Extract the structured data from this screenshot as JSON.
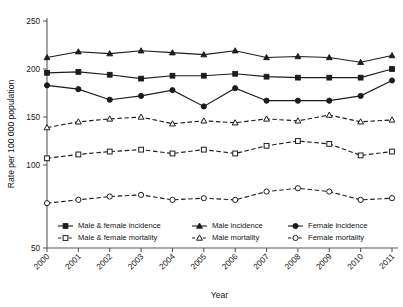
{
  "chart_data": {
    "type": "line",
    "title": "",
    "xlabel": "Year",
    "ylabel": "Rate per 100 000 population",
    "x": [
      "2000",
      "2001",
      "2002",
      "2003",
      "2004",
      "2005",
      "2006",
      "2007",
      "2008",
      "2009",
      "2010",
      "2011"
    ],
    "xlim": [
      2000,
      2011
    ],
    "ylim": [
      50,
      250
    ],
    "yticks": [
      50,
      100,
      150,
      200,
      250
    ],
    "grid": false,
    "legend_position": "bottom-inside",
    "series": [
      {
        "name": "Male & female incidence",
        "marker": "square-filled",
        "line_style": "solid",
        "values": [
          196,
          197,
          194,
          190,
          193,
          193,
          195,
          192,
          191,
          191,
          191,
          200
        ]
      },
      {
        "name": "Male incidence",
        "marker": "triangle-filled",
        "line_style": "solid",
        "values": [
          212,
          218,
          216,
          219,
          217,
          215,
          219,
          212,
          213,
          212,
          207,
          214
        ]
      },
      {
        "name": "Female incidence",
        "marker": "circle-filled",
        "line_style": "solid",
        "values": [
          183,
          179,
          168,
          172,
          178,
          161,
          180,
          167,
          167,
          167,
          172,
          188
        ]
      },
      {
        "name": "Male & female mortality",
        "marker": "square-open",
        "line_style": "dashed",
        "values": [
          107,
          111,
          114,
          116,
          112,
          116,
          112,
          120,
          125,
          122,
          110,
          114
        ]
      },
      {
        "name": "Male mortality",
        "marker": "triangle-open",
        "line_style": "dashed",
        "values": [
          139,
          145,
          148,
          150,
          143,
          146,
          144,
          148,
          146,
          152,
          145,
          147
        ]
      },
      {
        "name": "Female mortality",
        "marker": "circle-open",
        "line_style": "dashed",
        "values": [
          77,
          79,
          81,
          82,
          79,
          80,
          79,
          84,
          86,
          84,
          79,
          80
        ]
      }
    ]
  },
  "legend": {
    "entries": [
      {
        "label": "Male & female incidence",
        "marker": "square-filled",
        "line_style": "solid"
      },
      {
        "label": "Male incidence",
        "marker": "triangle-filled",
        "line_style": "solid"
      },
      {
        "label": "Female incidence",
        "marker": "circle-filled",
        "line_style": "solid"
      },
      {
        "label": "Male & female mortality",
        "marker": "square-open",
        "line_style": "dashed"
      },
      {
        "label": "Male mortality",
        "marker": "triangle-open",
        "line_style": "dashed"
      },
      {
        "label": "Female mortality",
        "marker": "circle-open",
        "line_style": "dashed"
      }
    ]
  },
  "colors": {
    "line": "#1c1c1c",
    "axis": "#5a5a5a",
    "text": "#141414",
    "background": "#ffffff"
  }
}
